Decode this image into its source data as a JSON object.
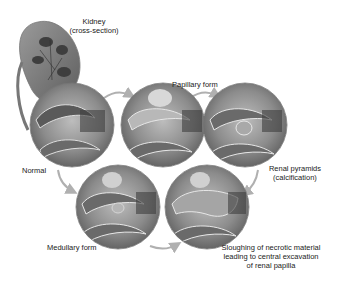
{
  "labels": {
    "kidney": "Kidney",
    "kidney_sub": "(cross-section)",
    "papillary": "Papillary form",
    "normal": "Normal",
    "renal_pyramids": "Renal pyramids",
    "renal_pyramids_sub": "(calcification)",
    "medullary": "Medullary form",
    "sloughing_1": "Sloughing of necrotic material",
    "sloughing_2": "leading to central excavation",
    "sloughing_3": "of renal papilla"
  },
  "stages": [
    {
      "id": "normal",
      "cx": 72,
      "cy": 125
    },
    {
      "id": "papillary-early",
      "cx": 163,
      "cy": 125
    },
    {
      "id": "papillary-calcification",
      "cx": 245,
      "cy": 125
    },
    {
      "id": "medullary",
      "cx": 118,
      "cy": 207
    },
    {
      "id": "sloughing",
      "cx": 207,
      "cy": 207
    }
  ],
  "colors": {
    "tissue_dark": "#4a4a4a",
    "tissue_mid": "#8a8a8a",
    "tissue_light": "#c8c8c8",
    "outline": "#e6e6e6",
    "arrow": "#b0b0b0"
  }
}
